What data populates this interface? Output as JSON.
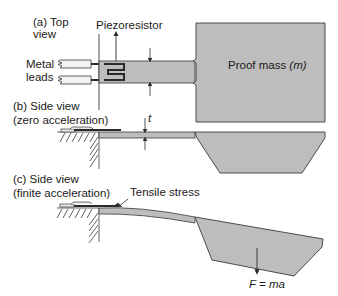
{
  "diagram": {
    "colors": {
      "fill": "#bdbdbd",
      "stroke": "#3a3a3a",
      "resistor": "#2a2a2a",
      "lead_fill": "#f2f2f2",
      "background": "#ffffff"
    },
    "panels": [
      {
        "id": "a",
        "title_line1": "(a) Top",
        "title_line2": "view",
        "labels": {
          "piezoresistor": "Piezoresistor",
          "metal_leads_line1": "Metal",
          "metal_leads_line2": "leads",
          "proof_mass_text": "Proof mass ",
          "proof_mass_symbol": "(m)"
        }
      },
      {
        "id": "b",
        "title_line1": "(b) Side view",
        "title_line2": "(zero acceleration)",
        "labels": {
          "thickness": "t"
        }
      },
      {
        "id": "c",
        "title_line1": "(c) Side view",
        "title_line2": "(finite acceleration)",
        "labels": {
          "tensile_stress": "Tensile stress",
          "force": "F = ma"
        }
      }
    ]
  }
}
